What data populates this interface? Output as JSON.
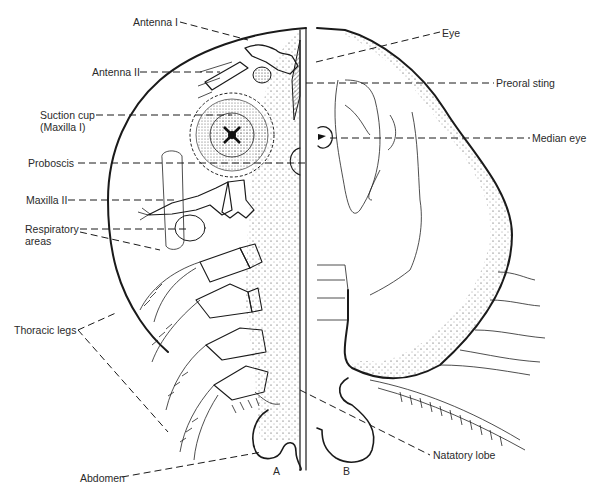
{
  "figure": {
    "panels": [
      {
        "id": "A",
        "label": "A",
        "description": "ventral view"
      },
      {
        "id": "B",
        "label": "B",
        "description": "dorsal view"
      }
    ],
    "labels": {
      "antenna_1": "Antenna I",
      "antenna_2": "Antenna II",
      "suction_cup_line1": "Suction cup",
      "suction_cup_line2": "(Maxilla I)",
      "proboscis": "Proboscis",
      "maxilla_2": "Maxilla II",
      "respiratory_line1": "Respiratory",
      "respiratory_line2": "areas",
      "thoracic_legs": "Thoracic legs",
      "abdomen": "Abdomen",
      "eye": "Eye",
      "preoral_sting": "Preoral sting",
      "median_eye": "Median eye",
      "natatory_lobe": "Natatory lobe"
    }
  }
}
